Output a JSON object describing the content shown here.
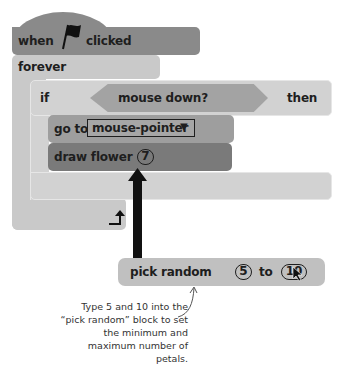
{
  "hat_block": {
    "when": "when",
    "icon": "green-flag",
    "clicked": "clicked"
  },
  "forever_block": {
    "label": "forever"
  },
  "if_block": {
    "if": "if",
    "condition": "mouse down?",
    "then": "then"
  },
  "goto_block": {
    "label": "go to",
    "dropdown": "mouse-pointer",
    "dropdown_arrow": "▼"
  },
  "draw_block": {
    "label": "draw flower",
    "value": "7"
  },
  "pick_random_block": {
    "label": "pick random",
    "min": "5",
    "to": "to",
    "max": "10"
  },
  "annotation": {
    "text": "Type 5 and 10 into the “pick random” block to set the minimum and maximum number of petals."
  },
  "colors": {
    "hat": "#8a8a8a",
    "forever": "#c9c9c9",
    "if": "#d2d2d2",
    "condition": "#a3a3a3",
    "goto": "#9e9e9e",
    "draw": "#7a7a7a",
    "pick_random": "#c0c0c0",
    "arrow": "#111111"
  }
}
